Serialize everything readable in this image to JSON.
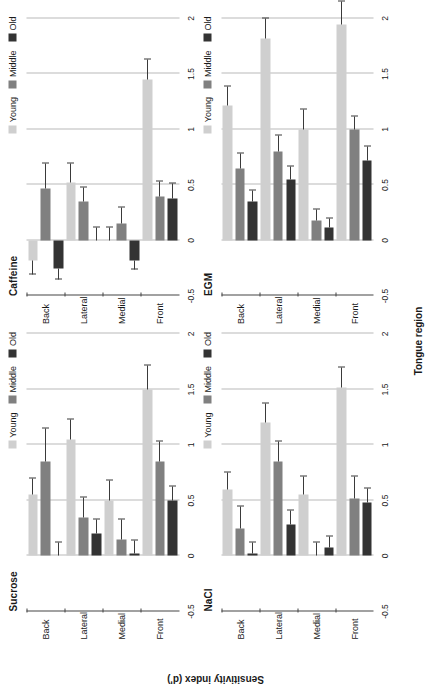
{
  "figure": {
    "xlabel": "Tongue region",
    "ylabel": "Sensitivity index (d')"
  },
  "legend": {
    "items": [
      {
        "label": "Young",
        "color": "#cfcfcf"
      },
      {
        "label": "Middle",
        "color": "#808080"
      },
      {
        "label": "Old",
        "color": "#333333"
      }
    ]
  },
  "axis": {
    "ticks": [
      "-0.5",
      "0",
      "0.5",
      "1",
      "1.5",
      "2"
    ],
    "min": -0.5,
    "max": 2
  },
  "chart_data": [
    {
      "type": "bar",
      "title": "Sucrose",
      "xlabel": "Tongue region",
      "ylabel": "Sensitivity index (d')",
      "ylim": [
        -0.5,
        2
      ],
      "categories": [
        "Back",
        "Lateral",
        "Medial",
        "Front"
      ],
      "series": [
        {
          "name": "Young",
          "values": [
            0.55,
            1.05,
            0.5,
            1.5
          ],
          "errors": [
            0.15,
            0.18,
            0.18,
            0.22
          ]
        },
        {
          "name": "Middle",
          "values": [
            0.85,
            0.35,
            0.15,
            0.85
          ],
          "errors": [
            0.3,
            0.18,
            0.18,
            0.18
          ]
        },
        {
          "name": "Old",
          "values": [
            0.0,
            0.2,
            0.02,
            0.5
          ],
          "errors": [
            0.12,
            0.13,
            0.12,
            0.13
          ]
        }
      ],
      "grid": true,
      "legend_position": "top-right"
    },
    {
      "type": "bar",
      "title": "Caffeine",
      "xlabel": "Tongue region",
      "ylabel": "Sensitivity index (d')",
      "ylim": [
        -0.5,
        2
      ],
      "categories": [
        "Back",
        "Lateral",
        "Medial",
        "Front"
      ],
      "series": [
        {
          "name": "Young",
          "values": [
            -0.18,
            0.52,
            0.0,
            1.45
          ],
          "errors": [
            0.13,
            0.17,
            0.12,
            0.18
          ]
        },
        {
          "name": "Middle",
          "values": [
            0.47,
            0.35,
            0.15,
            0.4
          ],
          "errors": [
            0.22,
            0.13,
            0.15,
            0.13
          ]
        },
        {
          "name": "Old",
          "values": [
            -0.25,
            0.0,
            -0.18,
            0.38
          ],
          "errors": [
            0.1,
            0.12,
            0.08,
            0.13
          ]
        }
      ],
      "grid": true,
      "legend_position": "top-right"
    },
    {
      "type": "bar",
      "title": "NaCl",
      "xlabel": "Tongue region",
      "ylabel": "Sensitivity index (d')",
      "ylim": [
        -0.5,
        2
      ],
      "categories": [
        "Back",
        "Lateral",
        "Medial",
        "Front"
      ],
      "series": [
        {
          "name": "Young",
          "values": [
            0.6,
            1.2,
            0.55,
            1.52
          ],
          "errors": [
            0.15,
            0.17,
            0.17,
            0.18
          ]
        },
        {
          "name": "Middle",
          "values": [
            0.25,
            0.85,
            0.0,
            0.52
          ],
          "errors": [
            0.2,
            0.18,
            0.12,
            0.2
          ]
        },
        {
          "name": "Old",
          "values": [
            0.02,
            0.28,
            0.08,
            0.48
          ],
          "errors": [
            0.1,
            0.13,
            0.1,
            0.13
          ]
        }
      ],
      "grid": true,
      "legend_position": "top-right"
    },
    {
      "type": "bar",
      "title": "EGM",
      "xlabel": "Tongue region",
      "ylabel": "Sensitivity index (d')",
      "ylim": [
        -0.5,
        2
      ],
      "categories": [
        "Back",
        "Lateral",
        "Medial",
        "Front"
      ],
      "series": [
        {
          "name": "Young",
          "values": [
            1.22,
            1.82,
            1.0,
            1.95
          ],
          "errors": [
            0.17,
            0.18,
            0.18,
            0.2
          ]
        },
        {
          "name": "Middle",
          "values": [
            0.65,
            0.8,
            0.18,
            1.0
          ],
          "errors": [
            0.13,
            0.15,
            0.1,
            0.12
          ]
        },
        {
          "name": "Old",
          "values": [
            0.35,
            0.55,
            0.12,
            0.72
          ],
          "errors": [
            0.1,
            0.12,
            0.08,
            0.13
          ]
        }
      ],
      "grid": true,
      "legend_position": "top-right"
    }
  ]
}
